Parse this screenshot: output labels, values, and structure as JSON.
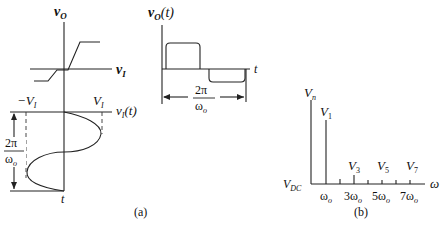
{
  "figure": {
    "panel_a": {
      "label": "(a)",
      "transfer_characteristic": {
        "y_axis_label": "v",
        "y_axis_sub": "O",
        "x_axis_label": "v",
        "x_axis_sub": "I",
        "neg_threshold_label": "−V",
        "neg_threshold_sub": "I",
        "pos_threshold_label": "V",
        "pos_threshold_sub": "I"
      },
      "input_waveform": {
        "axis_label": "v",
        "axis_sub": "I",
        "axis_arg": "(t)",
        "time_label": "t",
        "period_num": "2π",
        "period_den": "ω",
        "period_den_sub": "o"
      },
      "output_waveform": {
        "axis_label": "v",
        "axis_sub": "O",
        "axis_arg": "(t)",
        "time_label": "t",
        "period_num": "2π",
        "period_den": "ω",
        "period_den_sub": "o"
      }
    },
    "panel_b": {
      "label": "(b)",
      "y_axis_label": "V",
      "y_axis_sub": "n",
      "x_axis_label": "ω",
      "dc_label": "V",
      "dc_sub": "DC",
      "harmonics": [
        {
          "name": "V",
          "sub": "1",
          "freq": "ω",
          "freq_sub": "o"
        },
        {
          "name": "V",
          "sub": "3",
          "freq": "3ω",
          "freq_sub": "o"
        },
        {
          "name": "V",
          "sub": "5",
          "freq": "5ω",
          "freq_sub": "o"
        },
        {
          "name": "V",
          "sub": "7",
          "freq": "7ω",
          "freq_sub": "o"
        }
      ]
    }
  }
}
